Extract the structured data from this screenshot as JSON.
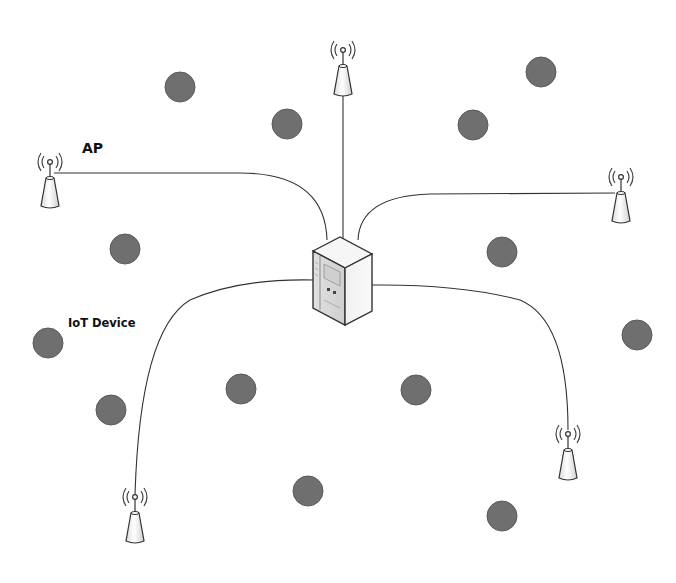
{
  "diagram": {
    "labels": {
      "ap": "AP",
      "iot_device": "IoT Device"
    },
    "colors": {
      "background": "#ffffff",
      "device": "#6f6f6f",
      "device_stroke": "#555555",
      "link": "#333333",
      "ap_body": "#f4f4f4"
    },
    "server": {
      "x": 340,
      "y": 282
    },
    "access_points": [
      {
        "id": "ap-top",
        "x": 343,
        "y": 58
      },
      {
        "id": "ap-left",
        "x": 50,
        "y": 170
      },
      {
        "id": "ap-right",
        "x": 621,
        "y": 185
      },
      {
        "id": "ap-bottom-left",
        "x": 135,
        "y": 505
      },
      {
        "id": "ap-bottom-right",
        "x": 568,
        "y": 442
      }
    ],
    "iot_devices": [
      {
        "x": 180,
        "y": 87
      },
      {
        "x": 287,
        "y": 124
      },
      {
        "x": 473,
        "y": 125
      },
      {
        "x": 541,
        "y": 72
      },
      {
        "x": 125,
        "y": 249
      },
      {
        "x": 502,
        "y": 252
      },
      {
        "x": 48,
        "y": 343
      },
      {
        "x": 637,
        "y": 335
      },
      {
        "x": 241,
        "y": 389
      },
      {
        "x": 416,
        "y": 390
      },
      {
        "x": 111,
        "y": 410
      },
      {
        "x": 308,
        "y": 491
      },
      {
        "x": 502,
        "y": 516
      }
    ]
  }
}
